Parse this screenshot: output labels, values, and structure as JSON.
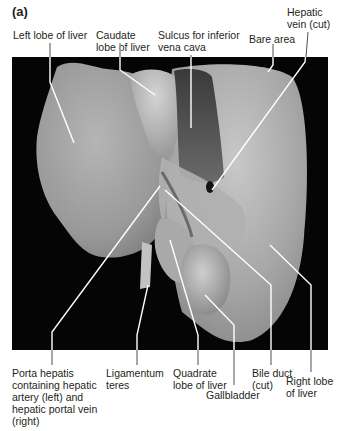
{
  "figure": {
    "panel": "(a)",
    "background_color": "#050505",
    "leader_color": "#ffffff",
    "text_color": "#231f20"
  },
  "labels": {
    "top": [
      {
        "id": "left-lobe",
        "text": "Left lobe of liver"
      },
      {
        "id": "caudate-lobe",
        "text": "Caudate\nlobe of liver"
      },
      {
        "id": "sulcus-ivc",
        "text": "Sulcus for inferior\nvena cava"
      },
      {
        "id": "bare-area",
        "text": "Bare area"
      },
      {
        "id": "hepatic-vein",
        "text": "Hepatic\nvein (cut)"
      }
    ],
    "bottom": [
      {
        "id": "porta-hepatis",
        "text": "Porta hepatis\ncontaining hepatic\nartery (left) and\nhepatic portal vein\n(right)"
      },
      {
        "id": "ligamentum-teres",
        "text": "Ligamentum\nteres"
      },
      {
        "id": "quadrate-lobe",
        "text": "Quadrate\nlobe of liver"
      },
      {
        "id": "gallbladder",
        "text": "Gallbladder"
      },
      {
        "id": "bile-duct",
        "text": "Bile duct\n(cut)"
      },
      {
        "id": "right-lobe",
        "text": "Right lobe\nof liver"
      }
    ]
  }
}
